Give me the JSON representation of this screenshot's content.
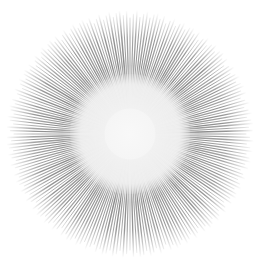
{
  "graphic": {
    "type": "radial-starburst",
    "center": [
      130,
      134
    ],
    "inner_radius": 52,
    "outer_radius": 122,
    "ray_count": 220,
    "colors": {
      "background": "#ffffff",
      "ray": "#9a9a9a",
      "ray_dark": "#8a8a8a",
      "center_disc": "#f4f4f4"
    }
  }
}
